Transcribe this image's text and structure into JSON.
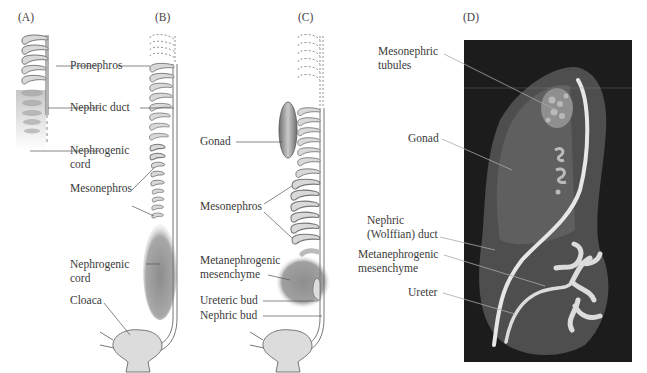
{
  "panels": {
    "A": {
      "letter": "(A)"
    },
    "B": {
      "letter": "(B)"
    },
    "C": {
      "letter": "(C)"
    },
    "D": {
      "letter": "(D)"
    }
  },
  "labels_AB": {
    "pronephros": "Pronephros",
    "nephric_duct": "Nephric duct",
    "nephrogenic_cord_1": "Nephrogenic",
    "nephrogenic_cord_1b": "cord",
    "mesonephros": "Mesonephros",
    "nephrogenic_cord_2": "Nephrogenic",
    "nephrogenic_cord_2b": "cord",
    "cloaca": "Cloaca"
  },
  "labels_C": {
    "gonad": "Gonad",
    "mesonephros": "Mesonephros",
    "metanephrogenic_1": "Metanephrogenic",
    "metanephrogenic_2": "mesenchyme",
    "ureteric_bud": "Ureteric bud",
    "nephric_bud": "Nephric bud"
  },
  "labels_D": {
    "mesonephric_1": "Mesonephric",
    "mesonephric_2": "tubules",
    "gonad": "Gonad",
    "nephric_1": "Nephric",
    "nephric_2": "(Wolffian) duct",
    "metanephrogenic_1": "Metanephrogenic",
    "metanephrogenic_2": "mesenchyme",
    "ureter": "Ureter"
  },
  "colors": {
    "tissue_fill": "#d9d9d9",
    "outline": "#7a7a7a",
    "mesenchyme": "#8a8a8a",
    "photo_bg": "#1c1c1c",
    "leader": "#555555"
  }
}
